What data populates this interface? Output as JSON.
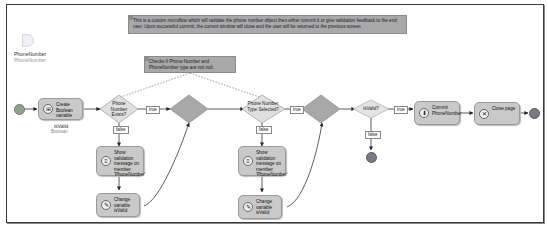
{
  "annotations": {
    "main": "This is a custom microflow which will validate the phone number object then either commit it or give validation feedback to the end user. Upon successful commit, the current window will close and the user will be returned to the previous screen.",
    "check": "Checks if Phone Number and PhoneNumber type are not null."
  },
  "parameter": {
    "name": "PhoneNumber",
    "type": "PhoneNumber"
  },
  "activities": {
    "create_variable": "Create Boolean variable",
    "show_validation_1": "Show validation message on member 'PhoneNumber'",
    "change_variable_1": "Change variable isValid",
    "show_validation_2": "Show validation message on member 'PhoneNumber'",
    "change_variable_2": "Change variable isValid",
    "commit": "Commit PhoneNumber",
    "close_page": "Close page"
  },
  "variable": {
    "name": "isValid",
    "type": "Boolean"
  },
  "decisions": {
    "d1": "Phone Number Exists?",
    "d2": "Phone Number Type Selected?",
    "d3": "isValid?"
  },
  "flow_labels": {
    "true1": "true",
    "false1": "false",
    "true2": "true",
    "false2": "false",
    "true3": "true",
    "false3": "false"
  },
  "colors": {
    "activity_fill": "#c9c9c9",
    "annotation_fill": "#a9a9a9",
    "decision_fill": "#e0e0e0",
    "merge_fill": "#a8a8a8",
    "start_event": "#8fa38a",
    "end_event": "#7a7a80"
  }
}
